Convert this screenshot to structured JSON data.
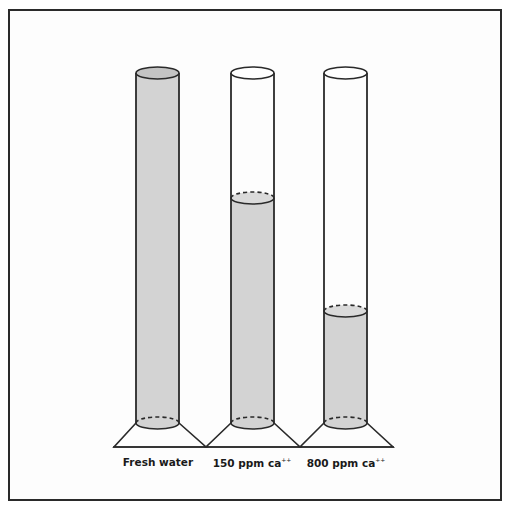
{
  "figure": {
    "type": "illustration",
    "colors": {
      "frame": "#2a2a2a",
      "outline": "#2a2a2a",
      "fill": "#d3d3d3",
      "background": "#ffffff"
    },
    "cylinders": [
      {
        "label": "Fresh water",
        "label_main": "Fresh water",
        "label_sup": "",
        "fill_fraction": 1.0
      },
      {
        "label": "150 ppm ca++",
        "label_main": "150 ppm ca",
        "label_sup": "++",
        "fill_fraction": 0.64
      },
      {
        "label": "800 ppm ca++",
        "label_main": "800 ppm ca",
        "label_sup": "++",
        "fill_fraction": 0.32
      }
    ]
  }
}
